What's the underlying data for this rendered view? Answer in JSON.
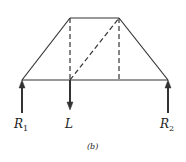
{
  "diagram": {
    "caption": "(b)",
    "labels": {
      "r1": "R",
      "r1_sub": "1",
      "l": "L",
      "r2": "R",
      "r2_sub": "2"
    },
    "colors": {
      "stroke": "#333333"
    },
    "truss": {
      "nodes": {
        "bottom_left": [
          22,
          80
        ],
        "bottom_mid_left": [
          70,
          80
        ],
        "bottom_mid_right": [
          119,
          80
        ],
        "bottom_right": [
          168,
          80
        ],
        "top_left": [
          70,
          18
        ],
        "top_right": [
          119,
          18
        ]
      },
      "solid_members": [
        "bottom chord",
        "top chord",
        "left incline",
        "right incline"
      ],
      "dashed_members": [
        "left vertical",
        "right vertical",
        "diagonal"
      ]
    },
    "forces": [
      {
        "name": "R1",
        "direction": "up",
        "x": 22
      },
      {
        "name": "L",
        "direction": "down",
        "x": 70
      },
      {
        "name": "R2",
        "direction": "up",
        "x": 168
      }
    ]
  }
}
